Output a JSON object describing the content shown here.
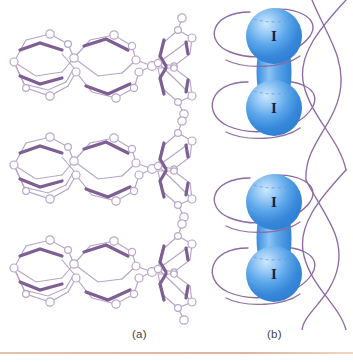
{
  "figure": {
    "background_color": "#ffffff",
    "width": 353,
    "height": 362
  },
  "captions": {
    "panel_a_label": "(a)",
    "panel_b_label": "(b)"
  },
  "panel_a": {
    "title": "macrocyclic-host-stack",
    "description": "Three stacked macrocyclic ring structures drawn as ball-and-stick skeletons",
    "repeat_count": 3,
    "atom_fill_color": "#ffffff",
    "atom_stroke_color": "#b9a7c9",
    "bond_color_thin": "#b6a4c6",
    "bond_color_thick": "#7e5f93"
  },
  "panel_b": {
    "title": "iodine-molecule-stack",
    "description": "Two diatomic iodine molecules shown as fused blue spheres with purple orbital loops",
    "molecule_count": 2,
    "atom_label": "I",
    "atoms_per_molecule": 2,
    "sphere_color_light": "#a9d4f7",
    "sphere_color_mid": "#4f9ee8",
    "sphere_color_deep": "#2f7fd4",
    "orbital_curve_color": "#8d6aa3",
    "atom_label_color": "#16214a",
    "dashed_ring_color": "#6f9fd8"
  },
  "colors": {
    "purple": "#8d6aa3",
    "light_purple": "#b6a4c6",
    "deep_purple": "#7e5f93",
    "blue": "#4f9ee8",
    "rule": "#e2b39c",
    "caption_text": "#3f3f46"
  }
}
